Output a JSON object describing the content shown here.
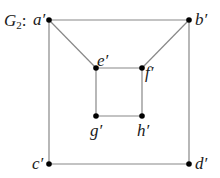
{
  "graph": {
    "title_main": "G",
    "title_sub": "2",
    "title_suffix": ":",
    "edge_color": "#888888",
    "node_color": "#000000",
    "nodes": [
      {
        "id": "a",
        "label": "a′",
        "x": 49,
        "y": 20
      },
      {
        "id": "b",
        "label": "b′",
        "x": 189,
        "y": 20
      },
      {
        "id": "e",
        "label": "e′",
        "x": 96,
        "y": 68
      },
      {
        "id": "f",
        "label": "f′",
        "x": 142,
        "y": 68
      },
      {
        "id": "g",
        "label": "g′",
        "x": 96,
        "y": 116
      },
      {
        "id": "h",
        "label": "h′",
        "x": 142,
        "y": 116
      },
      {
        "id": "c",
        "label": "c′",
        "x": 49,
        "y": 164
      },
      {
        "id": "d",
        "label": "d′",
        "x": 189,
        "y": 164
      }
    ],
    "edges": [
      [
        "a",
        "b"
      ],
      [
        "a",
        "c"
      ],
      [
        "b",
        "d"
      ],
      [
        "c",
        "d"
      ],
      [
        "a",
        "e"
      ],
      [
        "b",
        "f"
      ],
      [
        "e",
        "f"
      ],
      [
        "e",
        "g"
      ],
      [
        "f",
        "h"
      ],
      [
        "g",
        "h"
      ]
    ]
  }
}
